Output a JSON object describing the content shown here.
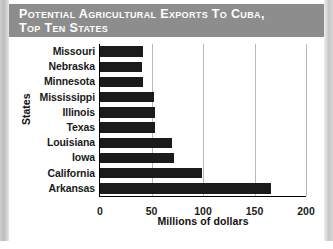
{
  "title": {
    "line1": "Potential Agricultural Exports to Cuba,",
    "line2": "Top Ten States"
  },
  "chart_data": {
    "type": "bar",
    "orientation": "horizontal",
    "title": "Potential Agricultural Exports to Cuba, Top Ten States",
    "categories": [
      "Missouri",
      "Nebraska",
      "Minnesota",
      "Mississippi",
      "Illinois",
      "Texas",
      "Louisiana",
      "Iowa",
      "California",
      "Arkansas"
    ],
    "values": [
      42,
      41,
      42,
      52,
      53,
      53,
      70,
      72,
      99,
      166
    ],
    "xlabel": "Millions of dollars",
    "ylabel": "States",
    "xlim": [
      0,
      200
    ],
    "xticks": [
      0,
      50,
      100,
      150,
      200
    ],
    "xtick_labels": [
      "0",
      "50",
      "100",
      "150",
      "200"
    ],
    "grid": "vertical",
    "legend": "none",
    "bar_color": "#1b1b1b",
    "gridline_color": "#b9b9b9",
    "banner_color": "#8d8d8d"
  }
}
